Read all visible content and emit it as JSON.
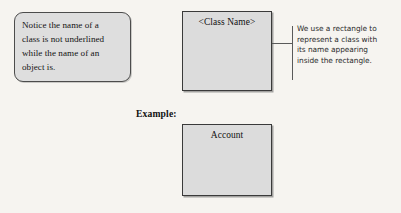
{
  "diagram": {
    "background_color": "#f6f4f0",
    "callout": {
      "name": "class-name-note",
      "lines": [
        "Notice the name of a",
        "class is not underlined",
        "while the name of an",
        "object is."
      ],
      "text": "Notice the name of a class is not underlined while the name of an object is.",
      "fill_color": "#dedede",
      "border_color": "#4c4c4c"
    },
    "class_box": {
      "name": "generic-class",
      "title": "<Class Name>",
      "fill_color": "#dcdcdc",
      "border_color": "#3a3a3a"
    },
    "annotation": {
      "name": "rectangle-explanation",
      "lines": [
        "We use a rectangle to",
        "represent a class with",
        "its name appearing",
        "inside the rectangle."
      ],
      "text": "We use a rectangle to represent a class with its name appearing inside the rectangle.",
      "rule_color": "#5a5a5a"
    },
    "example": {
      "label": "Example:",
      "class_box": {
        "name": "account-class",
        "title": "Account",
        "fill_color": "#dcdcdc",
        "border_color": "#3a3a3a"
      }
    }
  }
}
